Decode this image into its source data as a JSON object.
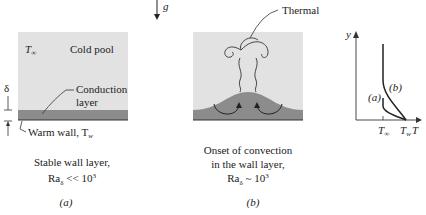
{
  "gravity": {
    "label": "g"
  },
  "panel_a": {
    "t_inf": "T",
    "t_inf_sub": "∞",
    "cold_pool": "Cold pool",
    "delta": "δ",
    "conduction_1": "Conduction",
    "conduction_2": "layer",
    "warm_wall": "Warm wall, T",
    "warm_wall_sub": "w",
    "caption_1": "Stable wall layer,",
    "caption_2": "Ra",
    "caption_2_sub": "δ",
    "caption_2_rest": " << 10",
    "caption_2_sup": "3",
    "tag": "(a)"
  },
  "panel_b": {
    "thermal": "Thermal",
    "caption_1": "Onset of convection",
    "caption_2": "in the wall layer,",
    "caption_3": "Ra",
    "caption_3_sub": "δ",
    "caption_3_rest": " ~ 10",
    "caption_3_sup": "3",
    "tag": "(b)"
  },
  "profile_plot": {
    "y_axis": "y",
    "x_axis": "T",
    "tick_t_inf": "T",
    "tick_t_inf_sub": "∞",
    "tick_t_w": "T",
    "tick_t_w_sub": "w",
    "curve_a": "(a)",
    "curve_b": "(b)"
  }
}
